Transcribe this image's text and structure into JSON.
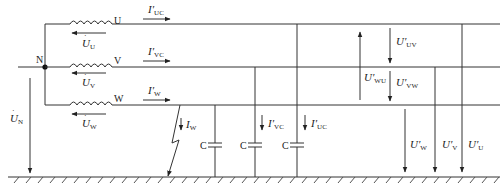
{
  "diagram": {
    "type": "circuit",
    "colors": {
      "line": "#333333",
      "background": "#ffffff"
    },
    "nodes": {
      "neutral": "N",
      "phase_u": "U",
      "phase_v": "V",
      "phase_w": "W"
    },
    "source_voltages": {
      "u": {
        "symbol": "U",
        "sub": "U"
      },
      "v": {
        "symbol": "U",
        "sub": "V"
      },
      "w": {
        "symbol": "U",
        "sub": "W"
      },
      "n": {
        "symbol": "U",
        "sub": "N"
      }
    },
    "line_currents": {
      "u": {
        "symbol": "I′",
        "sub": "UC"
      },
      "v": {
        "symbol": "I′",
        "sub": "VC"
      },
      "w": {
        "symbol": "I′",
        "sub": "W"
      }
    },
    "fault": {
      "current": {
        "symbol": "I",
        "sub": "W"
      }
    },
    "capacitors": [
      {
        "label": "C"
      },
      {
        "label": "C",
        "current": {
          "symbol": "I′",
          "sub": "VC"
        }
      },
      {
        "label": "C",
        "current": {
          "symbol": "I′",
          "sub": "UC"
        }
      }
    ],
    "line_voltages": {
      "uv": {
        "symbol": "U′",
        "sub": "UV"
      },
      "vw": {
        "symbol": "U′",
        "sub": "VW"
      },
      "wu": {
        "symbol": "U′",
        "sub": "WU"
      }
    },
    "phase_to_ground_voltages": {
      "w": {
        "symbol": "U′",
        "sub": "W"
      },
      "v": {
        "symbol": "U′",
        "sub": "V"
      },
      "u": {
        "symbol": "U′",
        "sub": "U"
      }
    }
  }
}
